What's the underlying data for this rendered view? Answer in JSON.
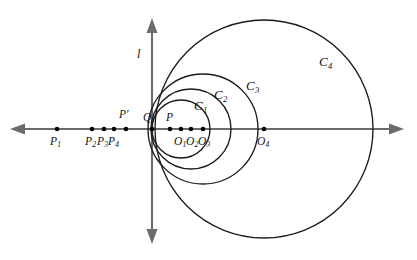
{
  "figure": {
    "type": "geometry-diagram",
    "background_color": "#ffffff",
    "axis_color": "#6b6b6b",
    "curve_color": "#1b1b1b",
    "point_color": "#000000"
  },
  "axes": {
    "vertical": {
      "label": "l",
      "x": 152,
      "y_top": 18,
      "y_bottom": 244,
      "arrow_top": true,
      "arrow_bottom": true,
      "label_x": 137,
      "label_y": 48
    },
    "horizontal": {
      "label": "",
      "y": 129,
      "x_left": 10,
      "x_right": 404,
      "arrow_left": true,
      "arrow_right": true
    }
  },
  "points": [
    {
      "id": "P1",
      "label": "P",
      "sub": "1",
      "x": 57,
      "y": 129,
      "label_x": 50,
      "label_y": 136
    },
    {
      "id": "P2",
      "label": "P",
      "sub": "2",
      "x": 92,
      "y": 129,
      "label_x": 85,
      "label_y": 136
    },
    {
      "id": "P3",
      "label": "P",
      "sub": "3",
      "x": 104,
      "y": 129,
      "label_x": 97,
      "label_y": 136
    },
    {
      "id": "P4",
      "label": "P",
      "sub": "4",
      "x": 114,
      "y": 129,
      "label_x": 108,
      "label_y": 136
    },
    {
      "id": "Pprime",
      "label": "P′",
      "sub": "",
      "x": 126,
      "y": 129,
      "label_x": 119,
      "label_y": 109
    },
    {
      "id": "Q",
      "label": "Q",
      "sub": "",
      "x": 152,
      "y": 129,
      "label_x": 143,
      "label_y": 112
    },
    {
      "id": "P",
      "label": "P",
      "sub": "",
      "x": 170,
      "y": 129,
      "label_x": 166,
      "label_y": 112
    },
    {
      "id": "O1",
      "label": "O",
      "sub": "1",
      "x": 181,
      "y": 129,
      "label_x": 174,
      "label_y": 136
    },
    {
      "id": "O2",
      "label": "O",
      "sub": "2",
      "x": 191,
      "y": 129,
      "label_x": 186,
      "label_y": 136
    },
    {
      "id": "O3",
      "label": "O",
      "sub": "3",
      "x": 203,
      "y": 129,
      "label_x": 198,
      "label_y": 136
    },
    {
      "id": "O4",
      "label": "O",
      "sub": "4",
      "x": 264,
      "y": 129,
      "label_x": 257,
      "label_y": 136
    }
  ],
  "circles": [
    {
      "id": "C1",
      "label": "C",
      "sub": "1",
      "cx": 181,
      "cy": 129,
      "r": 29,
      "label_x": 194,
      "label_y": 99
    },
    {
      "id": "C2",
      "label": "C",
      "sub": "2",
      "cx": 191,
      "cy": 129,
      "r": 40,
      "label_x": 214,
      "label_y": 88
    },
    {
      "id": "C3",
      "label": "C",
      "sub": "3",
      "cx": 203,
      "cy": 129,
      "r": 55,
      "label_x": 246,
      "label_y": 79
    },
    {
      "id": "C4",
      "label": "C",
      "sub": "4",
      "cx": 264,
      "cy": 129,
      "r": 109,
      "label_x": 319,
      "label_y": 55
    }
  ]
}
